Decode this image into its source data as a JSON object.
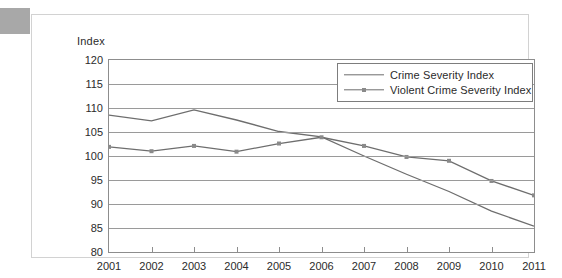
{
  "figure": {
    "axis_caption": "Index"
  },
  "legend": {
    "entries": [
      {
        "label": "Crime Severity Index",
        "marker": "none",
        "icon": "line-swatch-icon"
      },
      {
        "label": "Violent Crime Severity Index",
        "marker": "square",
        "icon": "line-marker-swatch-icon"
      }
    ]
  },
  "colors": {
    "line": "#6e6e6e",
    "marker": "#8a8a8a",
    "gridline": "#9a9a9a",
    "axis": "#8d8d8d",
    "frame": "#d2d2d2",
    "corner_block": "#a8a8a8",
    "text": "#2b2b2b"
  },
  "chart_data": {
    "type": "line",
    "title": "",
    "subtitle": "",
    "xlabel": "",
    "ylabel": "Index",
    "x": [
      2001,
      2002,
      2003,
      2004,
      2005,
      2006,
      2007,
      2008,
      2009,
      2010,
      2011
    ],
    "categories": [
      "2001",
      "2002",
      "2003",
      "2004",
      "2005",
      "2006",
      "2007",
      "2008",
      "2009",
      "2010",
      "2011"
    ],
    "xtick_labels": [
      "2001",
      "2002",
      "2003",
      "2004",
      "2005",
      "2006",
      "2007",
      "2008",
      "2009",
      "2010",
      "2011"
    ],
    "ytick_labels": [
      "120",
      "115",
      "110",
      "105",
      "100",
      "95",
      "90",
      "85",
      "80"
    ],
    "yticks": [
      120,
      115,
      110,
      105,
      100,
      95,
      90,
      85,
      80
    ],
    "ylim": [
      80,
      120
    ],
    "xlim": [
      2001,
      2011
    ],
    "grid": "horizontal",
    "legend_position": "upper-right",
    "series": [
      {
        "name": "Crime Severity Index",
        "marker": "none",
        "values": [
          108.5,
          107.3,
          109.6,
          107.5,
          105.1,
          104.0,
          100.0,
          96.2,
          92.6,
          88.5,
          85.4
        ]
      },
      {
        "name": "Violent Crime Severity Index",
        "marker": "square",
        "values": [
          101.9,
          101.0,
          102.1,
          100.9,
          102.6,
          103.9,
          102.1,
          99.8,
          99.0,
          94.8,
          91.8
        ]
      }
    ],
    "annotations": []
  }
}
